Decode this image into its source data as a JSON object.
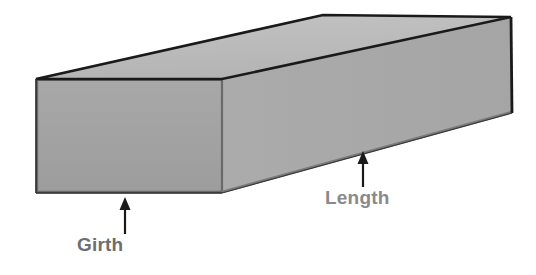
{
  "diagram": {
    "shape": {
      "name": "rectangular-box",
      "type": "3d-rectangular-prism",
      "face_colors": {
        "front": "#a3a3a3",
        "side": "#a8a8a8",
        "top": "#bcbcbc"
      },
      "outline_color": "#1a1a1a",
      "inner_edge_color": "#5a5a5a",
      "background": "#ffffff"
    },
    "annotations": [
      {
        "id": "girth",
        "label": "Girth",
        "color": "#6e6e6e",
        "arrow": {
          "color": "#1a1a1a",
          "direction": "up",
          "tail_x": 125,
          "tail_y": 233,
          "tip_x": 125,
          "tip_y": 198
        }
      },
      {
        "id": "length",
        "label": "Length",
        "color": "#8a8a8a",
        "arrow": {
          "color": "#1a1a1a",
          "direction": "up",
          "tail_x": 363,
          "tail_y": 186,
          "tip_x": 363,
          "tip_y": 152
        }
      }
    ],
    "vertices": {
      "front_top_left": [
        36,
        79
      ],
      "front_top_right": [
        222,
        79
      ],
      "front_bottom_left": [
        36,
        193
      ],
      "front_bottom_right": [
        222,
        193
      ],
      "back_top_left": [
        323,
        15
      ],
      "back_top_right": [
        511,
        17
      ],
      "back_bottom_right": [
        512,
        113
      ]
    }
  }
}
